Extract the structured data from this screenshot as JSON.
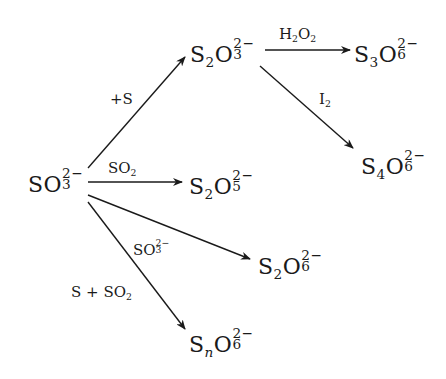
{
  "diagram": {
    "type": "reaction-scheme",
    "colors": {
      "ink": "#1a1a1a",
      "background": "#ffffff"
    },
    "species": {
      "sulfite": {
        "base": "SO",
        "sub": "3",
        "charge": "2−"
      },
      "thiosulfate": {
        "s_count": "2",
        "o_count": "3",
        "charge": "2−"
      },
      "trithionate": {
        "s_count": "3",
        "o_count": "6",
        "charge": "2−"
      },
      "tetrathionate": {
        "s_count": "4",
        "o_count": "6",
        "charge": "2−"
      },
      "disulfite": {
        "s_count": "2",
        "o_count": "5",
        "charge": "2−"
      },
      "dithionate": {
        "s_count": "2",
        "o_count": "6",
        "charge": "2−"
      },
      "polythionate": {
        "s_count": "n",
        "o_count": "6",
        "charge": "2−"
      }
    },
    "letters": {
      "S": "S",
      "O": "O"
    },
    "reagents": {
      "to_thiosulfate": "+S",
      "to_trithionate": {
        "base1": "H",
        "sub1": "2",
        "base2": "O",
        "sub2": "2"
      },
      "to_tetrathionate": {
        "base": "I",
        "sub": "2"
      },
      "to_disulfite": {
        "base": "SO",
        "sub": "2"
      },
      "to_dithionate": {
        "base": "SO",
        "sub": "3",
        "charge": "2−"
      },
      "to_polythionate": {
        "base": "S + SO",
        "sub": "2"
      }
    },
    "edges": [
      {
        "from": "SO3^2-",
        "to": "S2O3^2-",
        "label": "+S"
      },
      {
        "from": "S2O3^2-",
        "to": "S3O6^2-",
        "label": "H2O2"
      },
      {
        "from": "S2O3^2-",
        "to": "S4O6^2-",
        "label": "I2"
      },
      {
        "from": "SO3^2-",
        "to": "S2O5^2-",
        "label": "SO2"
      },
      {
        "from": "SO3^2-",
        "to": "S2O6^2-",
        "label": "SO3^2-"
      },
      {
        "from": "SO3^2-",
        "to": "SnO6^2-",
        "label": "S + SO2"
      }
    ]
  }
}
